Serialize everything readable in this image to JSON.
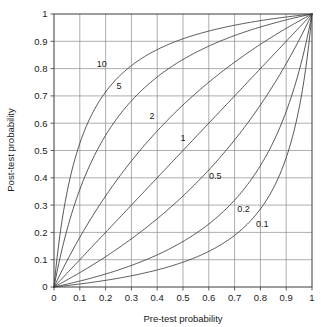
{
  "chart_data": {
    "type": "line",
    "title": "",
    "xlabel": "Pre-test probability",
    "ylabel": "Post-test probability",
    "xlim": [
      0,
      1
    ],
    "ylim": [
      0,
      1
    ],
    "grid": true,
    "legend": "inline-curve-labels",
    "x_ticks": [
      "0",
      "0.1",
      "0.2",
      "0.3",
      "0.4",
      "0.5",
      "0.6",
      "0.7",
      "0.8",
      "0.9",
      "1"
    ],
    "x_tick_values": [
      0,
      0.1,
      0.2,
      0.3,
      0.4,
      0.5,
      0.6,
      0.7,
      0.8,
      0.9,
      1
    ],
    "y_ticks": [
      "0",
      "0.1",
      "0.2",
      "0.3",
      "0.4",
      "0.5",
      "0.6",
      "0.7",
      "0.8",
      "0.9",
      "1"
    ],
    "y_tick_values": [
      0,
      0.1,
      0.2,
      0.3,
      0.4,
      0.5,
      0.6,
      0.7,
      0.8,
      0.9,
      1
    ],
    "x": [
      0,
      0.05,
      0.1,
      0.15,
      0.2,
      0.25,
      0.3,
      0.35,
      0.4,
      0.45,
      0.5,
      0.55,
      0.6,
      0.65,
      0.7,
      0.75,
      0.8,
      0.85,
      0.9,
      0.95,
      1
    ],
    "series": [
      {
        "name": "10",
        "label": "10",
        "likelihood_ratio": 10,
        "color": "#3a3a3a",
        "label_x": 0.185,
        "label_y": 0.805,
        "values": [
          0,
          0.345,
          0.526,
          0.638,
          0.714,
          0.769,
          0.811,
          0.843,
          0.87,
          0.891,
          0.909,
          0.924,
          0.938,
          0.949,
          0.959,
          0.968,
          0.976,
          0.983,
          0.989,
          0.995,
          1
        ]
      },
      {
        "name": "5",
        "label": "5",
        "likelihood_ratio": 5,
        "color": "#3a3a3a",
        "label_x": 0.252,
        "label_y": 0.727,
        "values": [
          0,
          0.208,
          0.357,
          0.469,
          0.556,
          0.625,
          0.682,
          0.729,
          0.769,
          0.804,
          0.833,
          0.859,
          0.882,
          0.903,
          0.921,
          0.938,
          0.952,
          0.966,
          0.978,
          0.99,
          1
        ]
      },
      {
        "name": "2",
        "label": "2",
        "likelihood_ratio": 2,
        "color": "#3a3a3a",
        "label_x": 0.38,
        "label_y": 0.615,
        "values": [
          0,
          0.095,
          0.182,
          0.261,
          0.333,
          0.4,
          0.462,
          0.519,
          0.571,
          0.621,
          0.667,
          0.71,
          0.75,
          0.788,
          0.824,
          0.857,
          0.889,
          0.919,
          0.947,
          0.974,
          1
        ]
      },
      {
        "name": "1",
        "label": "1",
        "likelihood_ratio": 1,
        "color": "#3a3a3a",
        "label_x": 0.5,
        "label_y": 0.535,
        "values": [
          0,
          0.05,
          0.1,
          0.15,
          0.2,
          0.25,
          0.3,
          0.35,
          0.4,
          0.45,
          0.5,
          0.55,
          0.6,
          0.65,
          0.7,
          0.75,
          0.8,
          0.85,
          0.9,
          0.95,
          1
        ]
      },
      {
        "name": "0.5",
        "label": "0.5",
        "likelihood_ratio": 0.5,
        "color": "#3a3a3a",
        "label_x": 0.625,
        "label_y": 0.395,
        "values": [
          0,
          0.026,
          0.053,
          0.081,
          0.111,
          0.143,
          0.176,
          0.212,
          0.25,
          0.29,
          0.333,
          0.379,
          0.429,
          0.481,
          0.538,
          0.6,
          0.667,
          0.739,
          0.818,
          0.905,
          1
        ]
      },
      {
        "name": "0.2",
        "label": "0.2",
        "likelihood_ratio": 0.2,
        "color": "#3a3a3a",
        "label_x": 0.735,
        "label_y": 0.275,
        "values": [
          0,
          0.0105,
          0.0217,
          0.0341,
          0.0476,
          0.0625,
          0.0789,
          0.0972,
          0.1176,
          0.1406,
          0.1667,
          0.1964,
          0.2308,
          0.2706,
          0.3182,
          0.375,
          0.4444,
          0.5312,
          0.6429,
          0.7917,
          1
        ]
      },
      {
        "name": "0.1",
        "label": "0.1",
        "likelihood_ratio": 0.1,
        "color": "#3a3a3a",
        "label_x": 0.807,
        "label_y": 0.218,
        "values": [
          0,
          0.0053,
          0.0109,
          0.0173,
          0.0244,
          0.0323,
          0.0411,
          0.0511,
          0.0625,
          0.0756,
          0.0909,
          0.1091,
          0.1304,
          0.1566,
          0.1892,
          0.2308,
          0.2857,
          0.3617,
          0.4737,
          0.6552,
          1
        ]
      }
    ]
  },
  "axes": {
    "x_label": "Pre-test probability",
    "y_label": "Post-test probability"
  },
  "colors": {
    "curve": "#3a3a3a",
    "grid": "#8c8c8c",
    "frame": "#4d4d4d",
    "text": "#1a1a1a",
    "background": "#ffffff"
  }
}
